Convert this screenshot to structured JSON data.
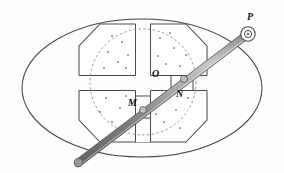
{
  "figure": {
    "type": "mechanism-diagram",
    "title": "",
    "canvas": {
      "width": 284,
      "height": 173,
      "background": "#fdfdfd"
    },
    "colors": {
      "outline": "#3a3a3a",
      "body_outline": "#4a4a4a",
      "dashed_circle": "#8a8a8a",
      "rod_light": "#b9b9b9",
      "rod_mid": "#8e8e8e",
      "rod_dark": "#6a6a6a",
      "label": "#111111",
      "hatch_dot": "#555555"
    },
    "labels": {
      "pivot_p": "P",
      "center_o": "O",
      "slider_m": "M",
      "slider_n": "N"
    },
    "parts": {
      "outer_housing": "ellipse",
      "body": "octagon-with-cross-slot",
      "inner_circle": "dotted-circle",
      "rod": "diagonal-shaft",
      "pivot": "pin-at-P",
      "sliders": [
        "M",
        "N"
      ]
    },
    "geometry": {
      "ellipse": {
        "cx": 142,
        "cy": 88,
        "rx": 121,
        "ry": 70
      },
      "dashed_circle": {
        "cx": 143,
        "cy": 82,
        "r": 53
      },
      "rod": {
        "x1": 78,
        "y1": 163,
        "x2": 248,
        "y2": 34,
        "width": 7
      },
      "pivot_p": {
        "cx": 248,
        "cy": 34,
        "r_outer": 7,
        "r_inner": 3.4
      },
      "slider_m": {
        "cx": 143,
        "cy": 110
      },
      "slider_n": {
        "cx": 186,
        "cy": 78
      },
      "center_o": {
        "cx": 143,
        "cy": 82
      }
    }
  }
}
